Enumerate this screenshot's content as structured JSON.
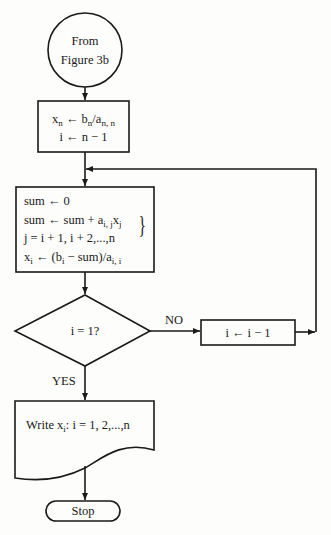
{
  "diagram": {
    "type": "flowchart",
    "start": {
      "shape": "connector-circle",
      "line1": "From",
      "line2": "Figure 3b"
    },
    "init_box": {
      "shape": "process",
      "line1": {
        "x": "x",
        "x_sub": "n",
        "arrow": " ← b",
        "b_sub": "n",
        "slash": "/a",
        "a_sub": "n, n"
      },
      "line2": "i ← n − 1"
    },
    "sum_box": {
      "shape": "process",
      "line1": "sum ← 0",
      "line2": {
        "pre": "sum ← sum + a",
        "a_sub": "i, j",
        "x": "x",
        "x_sub": "j"
      },
      "line3": "j = i + 1, i + 2,...,n",
      "line4": {
        "x": "x",
        "x_sub": "i",
        "mid": " ← (b",
        "b_sub": "i",
        "rest": " − sum)/a",
        "a_sub": "i, i"
      },
      "brace": "}"
    },
    "decision": {
      "shape": "diamond",
      "text": "i = 1?",
      "no_label": "NO",
      "yes_label": "YES"
    },
    "decrement_box": {
      "shape": "process",
      "text": "i ← i − 1"
    },
    "output": {
      "shape": "document",
      "pre": "Write x",
      "x_sub": "i",
      "rest": ": i = 1, 2,...,n"
    },
    "end": {
      "shape": "terminator",
      "text": "Stop"
    }
  },
  "colors": {
    "background": "#fdfdfb",
    "ink": "#1a1a1a"
  }
}
